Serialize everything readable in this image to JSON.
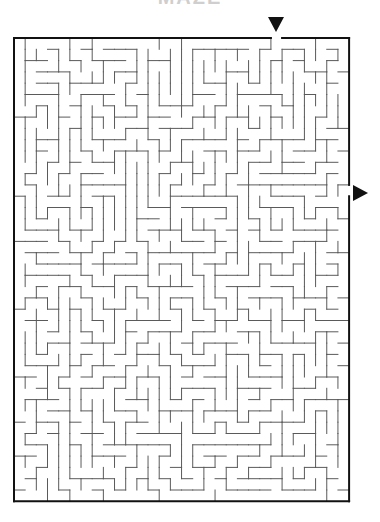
{
  "puzzle": {
    "title_partial": "MAZE",
    "grid": {
      "cols": 30,
      "rows": 41,
      "origin_x": 14,
      "origin_y": 38,
      "cell_w": 11.17,
      "cell_h": 11.3
    },
    "entrance": {
      "side": "top",
      "col": 23,
      "marker": "down-triangle"
    },
    "exit": {
      "side": "right",
      "row": 13,
      "marker": "right-triangle"
    },
    "colors": {
      "outer_wall": "#111111",
      "inner_wall": "#5a5a5a",
      "background": "#ffffff",
      "marker": "#111111"
    },
    "seed": 20240517
  }
}
